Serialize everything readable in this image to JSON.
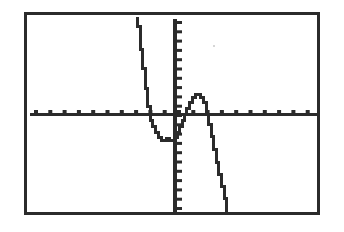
{
  "screen": {
    "device": "graphing-calculator",
    "label": "Graphing calculator display",
    "background_color": "#ffffff",
    "ink_color": "#2b2b2b",
    "frame": {
      "x": 24,
      "y": 12,
      "width": 296,
      "height": 203,
      "border_width": 3
    }
  },
  "chart_data": {
    "type": "line",
    "title": "",
    "subtitle": "",
    "xlabel": "",
    "ylabel": "",
    "grid": false,
    "legend": null,
    "legend_position": "none",
    "annotations": [],
    "tick_labels": {
      "x": [],
      "y": []
    },
    "axes": {
      "x_axis": {
        "orientation": "horizontal",
        "pixel_y": 98,
        "pixel_x_start": 3,
        "pixel_x_end": 290,
        "thickness": 3,
        "tick_count": 20,
        "tick_spacing_px": 14.3,
        "tick_direction": "up",
        "tick_length": 3,
        "tick_width": 4
      },
      "y_axis": {
        "orientation": "vertical",
        "pixel_x": 146,
        "pixel_y_start": 4,
        "pixel_y_end": 199,
        "thickness": 4,
        "tick_count": 21,
        "tick_spacing_px": 9.3,
        "tick_direction": "right",
        "tick_length": 5,
        "tick_width": 3
      }
    },
    "xlim": [
      -10,
      10
    ],
    "ylim": [
      -10,
      10
    ],
    "series": [
      {
        "name": "curve",
        "description": "Polynomial with a local minimum left of the y-axis and a local maximum right of the y-axis, falling steeply on both ends",
        "style": "pixelated-step",
        "stroke_width": 3,
        "points_px": [
          [
            109,
            2
          ],
          [
            109,
            10
          ],
          [
            112,
            10
          ],
          [
            112,
            22
          ],
          [
            112,
            33
          ],
          [
            114,
            33
          ],
          [
            114,
            44
          ],
          [
            114,
            52
          ],
          [
            117,
            52
          ],
          [
            117,
            62
          ],
          [
            117,
            72
          ],
          [
            119,
            72
          ],
          [
            119,
            82
          ],
          [
            119,
            90
          ],
          [
            122,
            90
          ],
          [
            122,
            98
          ],
          [
            122,
            104
          ],
          [
            124,
            104
          ],
          [
            124,
            110
          ],
          [
            127,
            110
          ],
          [
            127,
            116
          ],
          [
            130,
            116
          ],
          [
            130,
            121
          ],
          [
            133,
            121
          ],
          [
            133,
            124
          ],
          [
            138,
            124
          ],
          [
            138,
            122
          ],
          [
            141,
            122
          ],
          [
            141,
            124
          ],
          [
            146,
            124
          ],
          [
            146,
            121
          ],
          [
            149,
            121
          ],
          [
            149,
            116
          ],
          [
            151,
            116
          ],
          [
            151,
            110
          ],
          [
            154,
            110
          ],
          [
            154,
            104
          ],
          [
            156,
            104
          ],
          [
            156,
            98
          ],
          [
            158,
            98
          ],
          [
            158,
            92
          ],
          [
            161,
            92
          ],
          [
            161,
            86
          ],
          [
            164,
            86
          ],
          [
            164,
            81
          ],
          [
            167,
            81
          ],
          [
            167,
            78
          ],
          [
            172,
            78
          ],
          [
            172,
            81
          ],
          [
            175,
            81
          ],
          [
            175,
            86
          ],
          [
            178,
            86
          ],
          [
            178,
            92
          ],
          [
            178,
            98
          ],
          [
            180,
            98
          ],
          [
            180,
            108
          ],
          [
            183,
            108
          ],
          [
            183,
            120
          ],
          [
            185,
            120
          ],
          [
            185,
            133
          ],
          [
            188,
            133
          ],
          [
            188,
            146
          ],
          [
            190,
            146
          ],
          [
            190,
            158
          ],
          [
            193,
            158
          ],
          [
            193,
            170
          ],
          [
            196,
            170
          ],
          [
            196,
            182
          ],
          [
            198,
            182
          ],
          [
            198,
            196
          ]
        ],
        "features": {
          "left_branch": "descends from top border near x=109px",
          "local_minimum_px": [
            141,
            124
          ],
          "x_intercepts_px": [
            122,
            158,
            180
          ],
          "local_maximum_px": [
            170,
            78
          ],
          "right_branch": "descends to bottom border near x=198px"
        }
      }
    ]
  }
}
